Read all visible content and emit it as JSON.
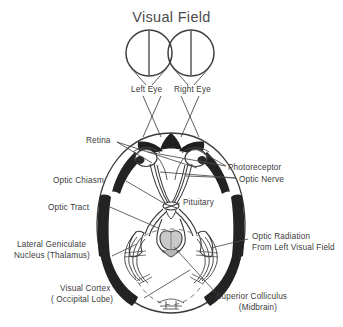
{
  "figure": {
    "title": "Visual Field",
    "colors": {
      "background": "#ffffff",
      "ink": "#3b3b3b",
      "line": "#4a4a4a",
      "shade": "#8a8a8a",
      "dark": "#232323"
    }
  },
  "visual_field": {
    "left_circle_label": "Left Eye",
    "right_circle_label": "Right Eye"
  },
  "labels": {
    "retina": "Retina",
    "photoreceptor": "Photoreceptor",
    "optic_nerve": "Optic Nerve",
    "optic_chiasm": "Optic Chiasm",
    "optic_tract": "Optic Tract",
    "pituitary": "Pituitary",
    "optic_radiation_line1": "Optic Radiation",
    "optic_radiation_line2": "From Left Visual Field",
    "lateral_geniculate_line1": "Lateral Geniculate",
    "lateral_geniculate_line2": "Nucleus (Thalamus)",
    "visual_cortex_line1": "Visual Cortex",
    "visual_cortex_line2": "( Occipital Lobe)",
    "superior_colliculus_line1": "Superior Colliculus",
    "superior_colliculus_line2": "(Midbrain)"
  }
}
